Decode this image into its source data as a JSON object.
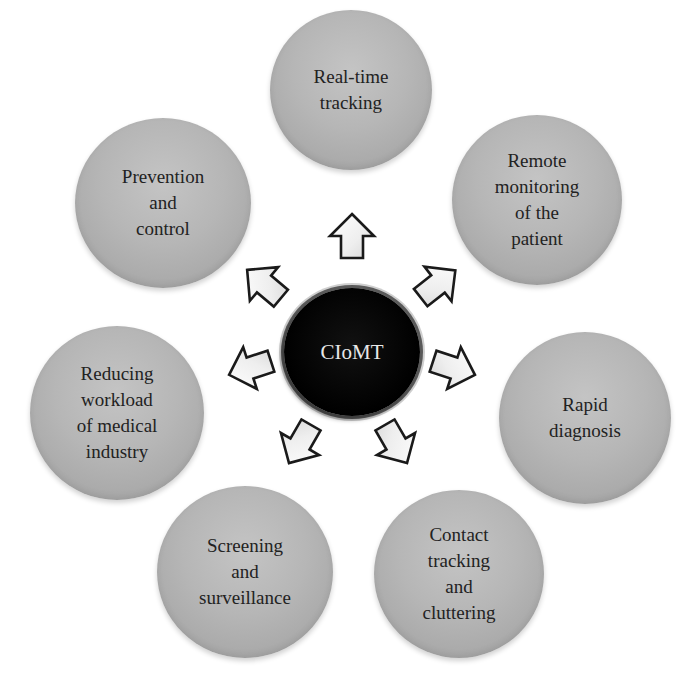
{
  "diagram": {
    "type": "hub-and-spoke",
    "hub": {
      "label": "CIoMT",
      "fill": "#000000",
      "text_color": "#e8e8e8"
    },
    "node_fill": "#b3b3b3",
    "arrow_fill": "#f2f2f2",
    "arrow_stroke": "#1a1a1a",
    "nodes": [
      {
        "id": "real-time-tracking",
        "label": "Real-time\ntracking",
        "position": "top"
      },
      {
        "id": "remote-monitoring",
        "label": "Remote\nmonitoring\nof the\npatient",
        "position": "top-right"
      },
      {
        "id": "rapid-diagnosis",
        "label": "Rapid\ndiagnosis",
        "position": "right"
      },
      {
        "id": "contact-tracking",
        "label": "Contact\ntracking\nand\ncluttering",
        "position": "bottom-right"
      },
      {
        "id": "screening",
        "label": "Screening\nand\nsurveillance",
        "position": "bottom-left"
      },
      {
        "id": "reducing-workload",
        "label": "Reducing\nworkload\nof medical\nindustry",
        "position": "left"
      },
      {
        "id": "prevention",
        "label": "Prevention\nand\ncontrol",
        "position": "top-left"
      }
    ]
  }
}
